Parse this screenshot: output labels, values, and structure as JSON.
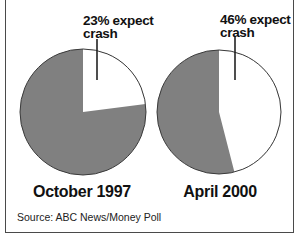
{
  "chart_data": {
    "type": "pie",
    "title": "",
    "charts": [
      {
        "title": "October 1997",
        "slices": [
          {
            "label": "23% expect crash",
            "value": 23,
            "color": "#ffffff"
          },
          {
            "label": "other",
            "value": 77,
            "color": "#808080"
          }
        ]
      },
      {
        "title": "April 2000",
        "slices": [
          {
            "label": "46% expect crash",
            "value": 46,
            "color": "#ffffff"
          },
          {
            "label": "other",
            "value": 54,
            "color": "#808080"
          }
        ]
      }
    ],
    "source": "Source: ABC News/Money Poll"
  },
  "pies": [
    {
      "label_line1": "23% expect",
      "label_line2": "crash",
      "title": "October 1997"
    },
    {
      "label_line1": "46% expect",
      "label_line2": "crash",
      "title": "April 2000"
    }
  ],
  "source": "Source: ABC News/Money Poll",
  "colors": {
    "slice": "#808080",
    "highlight": "#ffffff",
    "outline": "#3a3a3a"
  }
}
